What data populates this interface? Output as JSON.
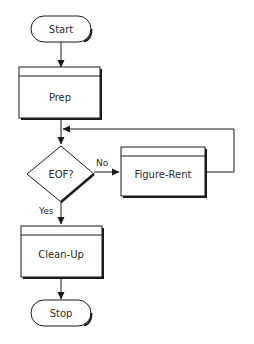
{
  "diagram": {
    "type": "flowchart",
    "colors": {
      "stroke": "#1a1a1a",
      "fill": "#ffffff",
      "text": "#2b2b2b"
    },
    "nodes": {
      "start": {
        "shape": "terminal",
        "label": "Start"
      },
      "prep": {
        "shape": "predefined-process",
        "label": "Prep"
      },
      "eof": {
        "shape": "decision",
        "label": "EOF?"
      },
      "figure_rent": {
        "shape": "predefined-process",
        "label": "Figure-Rent"
      },
      "cleanup": {
        "shape": "predefined-process",
        "label": "Clean-Up"
      },
      "stop": {
        "shape": "terminal",
        "label": "Stop"
      }
    },
    "edges": {
      "start_prep": {
        "from": "Start",
        "to": "Prep",
        "label": ""
      },
      "prep_eof": {
        "from": "Prep",
        "to": "EOF?",
        "label": ""
      },
      "eof_no": {
        "from": "EOF?",
        "to": "Figure-Rent",
        "label": "No"
      },
      "rent_loop": {
        "from": "Figure-Rent",
        "to": "EOF?",
        "label": ""
      },
      "eof_yes": {
        "from": "EOF?",
        "to": "Clean-Up",
        "label": "Yes"
      },
      "cleanup_stop": {
        "from": "Clean-Up",
        "to": "Stop",
        "label": ""
      }
    }
  }
}
